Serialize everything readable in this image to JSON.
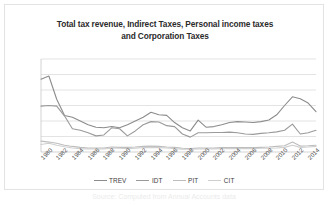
{
  "chart_data": {
    "type": "line",
    "title": "Total tax revenue, Indirect Taxes, Personal income taxes and Corporation Taxes",
    "title_line1": "Total tax revenue, Indirect Taxes, Personal income taxes",
    "title_line2": "and Corporation Taxes",
    "xlabel": "",
    "ylabel": "",
    "ylim": [
      0,
      300000
    ],
    "yticks": [
      300000,
      250000,
      200000,
      150000,
      100000,
      50000,
      0
    ],
    "ytick_labels": [
      "300000",
      "250000",
      "200000",
      "150000",
      "100000",
      "50000",
      "0"
    ],
    "grid": true,
    "legend_position": "bottom",
    "xlim": [
      1980,
      2015
    ],
    "x": [
      1980,
      1981,
      1982,
      1983,
      1984,
      1985,
      1986,
      1987,
      1988,
      1989,
      1990,
      1991,
      1992,
      1993,
      1994,
      1995,
      1996,
      1997,
      1998,
      1999,
      2000,
      2001,
      2002,
      2003,
      2004,
      2005,
      2006,
      2007,
      2008,
      2009,
      2010,
      2011,
      2012,
      2013,
      2014,
      2015
    ],
    "xtick_labels": [
      "1980",
      "1982",
      "1984",
      "1986",
      "1988",
      "1990",
      "1992",
      "1994",
      "1996",
      "1998",
      "2000",
      "2002",
      "2004",
      "2006",
      "2008",
      "2010",
      "2012",
      "2014"
    ],
    "series": [
      {
        "name": "TREV",
        "color": "#8c8c8c",
        "values": [
          235000,
          245000,
          170000,
          118000,
          112000,
          100000,
          88000,
          80000,
          78000,
          82000,
          78000,
          88000,
          100000,
          112000,
          128000,
          120000,
          118000,
          95000,
          78000,
          68000,
          103000,
          80000,
          82000,
          88000,
          95000,
          98000,
          97000,
          95000,
          98000,
          103000,
          120000,
          150000,
          178000,
          172000,
          158000,
          130000
        ]
      },
      {
        "name": "IDT",
        "color": "#9a9a9a",
        "values": [
          148000,
          150000,
          148000,
          116000,
          75000,
          70000,
          62000,
          52000,
          55000,
          78000,
          75000,
          52000,
          68000,
          88000,
          98000,
          97000,
          85000,
          82000,
          58000,
          48000,
          62000,
          62000,
          63000,
          63000,
          64000,
          62000,
          58000,
          57000,
          60000,
          62000,
          65000,
          70000,
          90000,
          58000,
          62000,
          70000
        ]
      },
      {
        "name": "PIT",
        "color": "#bdbdbd",
        "values": [
          35000,
          32000,
          28000,
          22000,
          18000,
          15000,
          13000,
          13000,
          13000,
          16000,
          15000,
          15000,
          16000,
          18000,
          19000,
          18000,
          16000,
          15000,
          12000,
          11000,
          13000,
          13000,
          13000,
          14000,
          14000,
          14000,
          14000,
          14000,
          15000,
          16000,
          18000,
          20000,
          32000,
          19000,
          20000,
          22000
        ]
      },
      {
        "name": "CIT",
        "color": "#cfcfcf",
        "values": [
          24000,
          28000,
          22000,
          17000,
          13000,
          11000,
          10000,
          10000,
          10000,
          12000,
          12000,
          11000,
          12000,
          14000,
          15000,
          14000,
          13000,
          11000,
          9000,
          9000,
          10000,
          10000,
          10000,
          11000,
          11000,
          11000,
          11000,
          11000,
          12000,
          12000,
          13000,
          15000,
          22000,
          15000,
          16000,
          18000
        ]
      }
    ]
  },
  "legend": {
    "items": [
      {
        "label": "TREV"
      },
      {
        "label": "IDT"
      },
      {
        "label": "PIT"
      },
      {
        "label": "CIT"
      }
    ]
  },
  "caption": {
    "text": "Source: Computed from Annual Accounts data"
  }
}
